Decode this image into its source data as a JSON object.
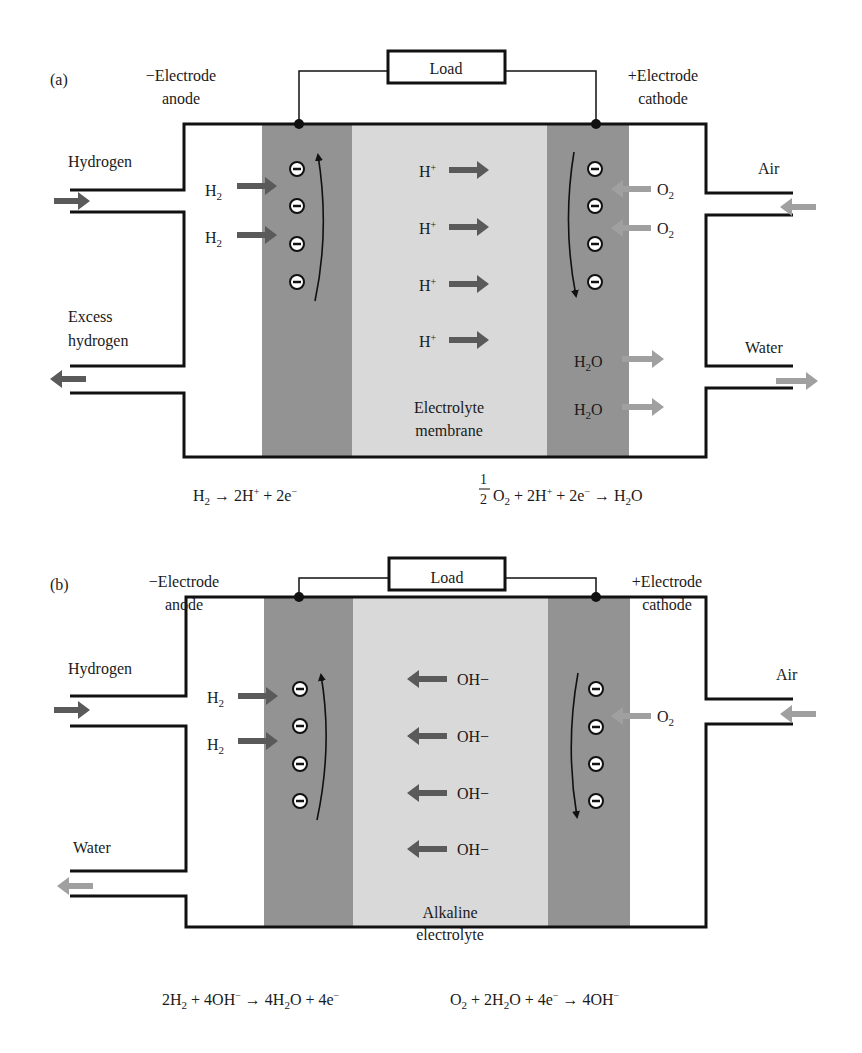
{
  "figure": {
    "panels": [
      {
        "id": "a",
        "label": "(a)",
        "load": "Load",
        "anode_label": [
          "−Electrode",
          "anode"
        ],
        "cathode_label": [
          "+Electrode",
          "cathode"
        ],
        "inlet_left": "Hydrogen",
        "outlet_left": [
          "Excess",
          "hydrogen"
        ],
        "inlet_right": "Air",
        "outlet_right": "Water",
        "anode_inputs": [
          "H2",
          "H2"
        ],
        "electrolyte_ions": [
          "H+",
          "H+",
          "H+",
          "H+"
        ],
        "ion_direction": "right",
        "cathode_inputs": [
          "O2",
          "O2"
        ],
        "cathode_outputs": [
          "H2O",
          "H2O"
        ],
        "electrolyte_name": [
          "Electrolyte",
          "membrane"
        ],
        "electron_count_anode": 4,
        "electron_count_cathode": 4,
        "anode_reaction": "H2 → 2H+ + 2e−",
        "cathode_reaction": "1/2 O2 + 2H+ + 2e− → H2O"
      },
      {
        "id": "b",
        "label": "(b)",
        "load": "Load",
        "anode_label": [
          "−Electrode",
          "anode"
        ],
        "cathode_label": [
          "+Electrode",
          "cathode"
        ],
        "inlet_left": "Hydrogen",
        "outlet_left": [
          "Water"
        ],
        "inlet_right": "Air",
        "anode_inputs": [
          "H2",
          "H2"
        ],
        "electrolyte_ions": [
          "OH−",
          "OH−",
          "OH−",
          "OH−"
        ],
        "ion_direction": "left",
        "cathode_inputs": [
          "O2"
        ],
        "electrolyte_name": [
          "Alkaline",
          "electrolyte"
        ],
        "electron_count_anode": 4,
        "electron_count_cathode": 4,
        "anode_reaction": "2H2 + 4OH− → 4H2O + 4e−",
        "cathode_reaction": "O2 + 2H2O + 4e− → 4OH−"
      }
    ],
    "colors": {
      "electrode": "#939393",
      "electrolyte": "#d9d9d9",
      "dark_arrow": "#5a5a5a",
      "light_arrow": "#a0a0a0",
      "line": "#111111"
    }
  }
}
